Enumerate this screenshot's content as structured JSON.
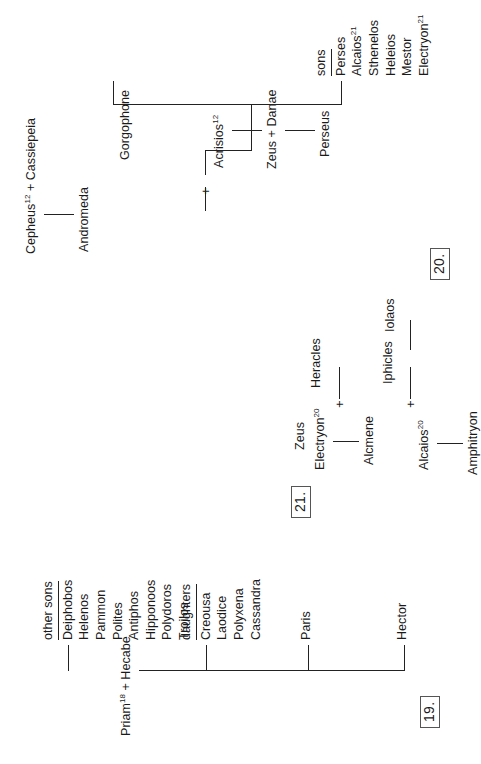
{
  "page": {
    "ink_color": "#1a1a1a"
  },
  "figures": [
    {
      "number_label": "19.",
      "root": {
        "left_parent": "Priam",
        "left_parent_sup": "18",
        "union_symbol": "+",
        "right_parent": "Hecabe",
        "full": "Priam¹⁸ + Hecabe"
      },
      "children": [
        {
          "kind": "person",
          "name": "Hector"
        },
        {
          "kind": "person",
          "name": "Paris"
        },
        {
          "kind": "group",
          "heading": "daughters",
          "members": [
            "Creousa",
            "Laodice",
            "Polyxena",
            "Cassandra"
          ]
        },
        {
          "kind": "group",
          "heading": "other sons",
          "members": [
            "Deiphobos",
            "Helenos",
            "Pammon",
            "Polites",
            "Antiphos",
            "Hipponoos",
            "Polydoros",
            "Troilos"
          ]
        }
      ]
    },
    {
      "number_label": "20.",
      "nodes": {
        "acrisios": "Acrisios",
        "acrisios_sup": "12",
        "zeus_danae": "Zeus + Danae",
        "perseus": "Perseus",
        "cepheus_cassiepeia": "Cepheus¹² + Cassiepeia",
        "cepheus": "Cepheus",
        "cepheus_sup": "12",
        "cassiepeia": "Cassiepeia",
        "andromeda": "Andromeda",
        "union_symbol": "+",
        "gorgophone": "Gorgophone",
        "sons_heading": "sons"
      },
      "sons": [
        "Perses",
        "Alcaios²¹",
        "Sthenelos",
        "Heleios",
        "Mestor",
        "Electryon²¹"
      ],
      "sons_plain": [
        {
          "name": "Perses",
          "sup": ""
        },
        {
          "name": "Alcaios",
          "sup": "21"
        },
        {
          "name": "Sthenelos",
          "sup": ""
        },
        {
          "name": "Heleios",
          "sup": ""
        },
        {
          "name": "Mestor",
          "sup": ""
        },
        {
          "name": "Electryon",
          "sup": "21"
        }
      ]
    },
    {
      "number_label": "21.",
      "nodes": {
        "alcaios": "Alcaios",
        "alcaios_sup": "20",
        "amphitryon": "Amphitryon",
        "electryon": "Electryon",
        "electryon_sup": "20",
        "alcmene": "Alcmene",
        "zeus": "Zeus",
        "heracles": "Heracles",
        "iphicles": "Iphicles",
        "iolaos": "Iolaos",
        "union_symbol_left": "+",
        "union_symbol_right": "+"
      }
    }
  ]
}
